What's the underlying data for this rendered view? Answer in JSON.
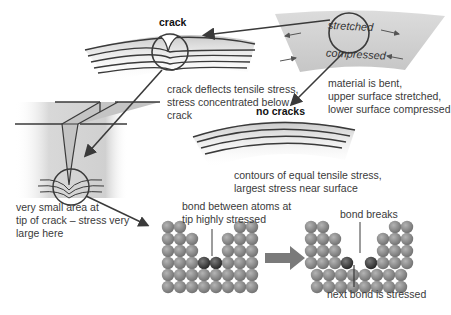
{
  "labels": {
    "crack_title": "crack",
    "no_cracks_title": "no cracks",
    "stretched": "stretched",
    "compressed": "compressed",
    "crack_deflects": "crack deflects tensile stress,\nstress concentrated below\ncrack",
    "material_bent": "material is bent,\nupper surface stretched,\nlower surface compressed",
    "contours": "contours of equal tensile stress,\nlargest stress near surface",
    "small_area": "very small area at\ntip of crack – stress very\nlarge here",
    "bond_between": "bond between atoms at\ntip highly stressed",
    "bond_breaks": "bond breaks",
    "next_bond": "next bond is stressed"
  },
  "colors": {
    "line": "#3a3a3a",
    "shade": "#cfcfcf",
    "atom": "#8a8a8a",
    "atom_stressed": "#3a3a3a",
    "arrow": "#7a7a7a"
  }
}
